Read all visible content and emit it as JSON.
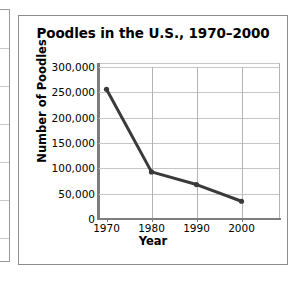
{
  "left_fragment": {
    "name": "adjacent-table-edge",
    "rule_positions": [
      38,
      76,
      114,
      152,
      190,
      228
    ]
  },
  "chart_data": {
    "type": "line",
    "title": "Poodles in the U.S., 1970–2000",
    "xlabel": "Year",
    "ylabel": "Number of Poodles",
    "categories": [
      "1970",
      "1980",
      "1990",
      "2000"
    ],
    "x": [
      1970,
      1980,
      1990,
      2000
    ],
    "values": [
      256000,
      93000,
      68000,
      35000
    ],
    "series": [
      {
        "name": "Number of Poodles",
        "values": [
          256000,
          93000,
          68000,
          35000
        ],
        "color": "#3a3a3a",
        "marker": "circle"
      }
    ],
    "ylim": [
      0,
      300000
    ],
    "ytick_values": [
      0,
      50000,
      100000,
      150000,
      200000,
      250000,
      300000
    ],
    "ytick_labels": [
      "0",
      "50,000",
      "100,000",
      "150,000",
      "200,000",
      "250,000",
      "300,000"
    ],
    "xtick_labels": [
      "1970",
      "1980",
      "1990",
      "2000"
    ],
    "grid": true,
    "legend": false,
    "grid_color": "#c6c6c6",
    "axis_color": "#7d7d7d",
    "border_color": "#8d8d8d"
  }
}
